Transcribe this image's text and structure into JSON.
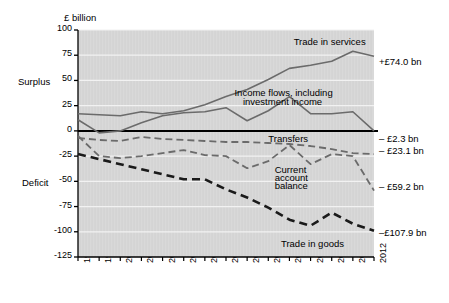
{
  "chart_data": {
    "type": "line",
    "title": "",
    "ylabel": "£ billion",
    "xlabel": "",
    "ylim": [
      -125,
      100
    ],
    "ytick_labels": [
      "100",
      "75",
      "50",
      "25",
      "0",
      "-25",
      "-50",
      "-75",
      "-100",
      "-125"
    ],
    "ytick_values": [
      100,
      75,
      50,
      25,
      0,
      -25,
      -50,
      -75,
      -100,
      -125
    ],
    "grid": true,
    "legend_position": "inline-annotations",
    "axis_region_labels": {
      "upper": "Surplus",
      "lower": "Deficit",
      "upper_at": 50,
      "lower_at": -50
    },
    "categories": [
      "1998",
      "1999",
      "2000",
      "2001",
      "2002",
      "2003",
      "2004",
      "2005",
      "2006",
      "2007",
      "2008",
      "2009",
      "2010",
      "2011",
      "2012"
    ],
    "x": [
      1998,
      1999,
      2000,
      2001,
      2002,
      2003,
      2004,
      2005,
      2006,
      2007,
      2008,
      2009,
      2010,
      2011,
      2012
    ],
    "series": [
      {
        "name": "Trade in services",
        "style": "solid-grey",
        "end_label": "+£74.0 bn",
        "values": [
          17,
          16,
          15,
          19,
          17,
          20,
          26,
          34,
          41,
          51,
          62,
          65,
          69,
          79,
          74
        ]
      },
      {
        "name": "Income flows, including investment income",
        "style": "solid-grey",
        "end_label": "",
        "values": [
          11,
          -2,
          0,
          8,
          15,
          18,
          19,
          23,
          10,
          20,
          34,
          17,
          17,
          19,
          0
        ]
      },
      {
        "name": "Transfers",
        "style": "dashed-grey",
        "end_label": "– £2.3 bn",
        "values": [
          -7,
          -9,
          -10,
          -6,
          -8,
          -9,
          -10,
          -11,
          -11,
          -12,
          -13,
          -15,
          -18,
          -22,
          -23.1
        ]
      },
      {
        "name": "Current account balance",
        "style": "dashed-grey",
        "end_label": "– £23.1 bn",
        "values": [
          -5,
          -25,
          -27,
          -25,
          -22,
          -19,
          -24,
          -25,
          -37,
          -30,
          -14,
          -33,
          -23,
          -25,
          -59.2
        ]
      },
      {
        "name": "Trade in goods",
        "style": "dashed-black-thick",
        "end_label": "–£107.9 bn",
        "values": [
          -23,
          -28,
          -33,
          -38,
          -43,
          -48,
          -48,
          -58,
          -66,
          -76,
          -88,
          -94,
          -81,
          -92,
          -99
        ]
      }
    ],
    "annotations": [
      {
        "id": "trade-in-services",
        "text": "Trade in services",
        "x": 2008.2,
        "y": 88
      },
      {
        "id": "income-flows",
        "text": "Income flows, including",
        "x": 2005.4,
        "y": 38
      },
      {
        "id": "income-flows-2",
        "text": "investment income",
        "x": 2005.8,
        "y": 29
      },
      {
        "id": "transfers",
        "text": "Transfers",
        "x": 2007.0,
        "y": -8
      },
      {
        "id": "current-account-balance-1",
        "text": "Current",
        "x": 2007.3,
        "y": -39
      },
      {
        "id": "current-account-balance-2",
        "text": "account",
        "x": 2007.3,
        "y": -47
      },
      {
        "id": "current-account-balance-3",
        "text": "balance",
        "x": 2007.3,
        "y": -55
      },
      {
        "id": "trade-in-goods",
        "text": "Trade in goods",
        "x": 2007.6,
        "y": -112
      }
    ],
    "end_labels": [
      {
        "id": "end-trade-in-services",
        "text": "+£74.0 bn",
        "y": 68
      },
      {
        "id": "end-transfers",
        "text": "– £2.3 bn",
        "y": -8
      },
      {
        "id": "end-current-account",
        "text": "– £23.1 bn",
        "y": -20
      },
      {
        "id": "end-income-flows",
        "text": "– £59.2 bn",
        "y": -56
      },
      {
        "id": "end-trade-in-goods",
        "text": "–£107.9 bn",
        "y": -101
      }
    ],
    "colors": {
      "plot_background": "#d9d9d9",
      "grid": "#f2f2f2",
      "axis": "#000000",
      "zero_line": "#000000",
      "grey_series": "#6b6b6b",
      "black_series": "#1a1a1a",
      "text": "#000000"
    }
  }
}
